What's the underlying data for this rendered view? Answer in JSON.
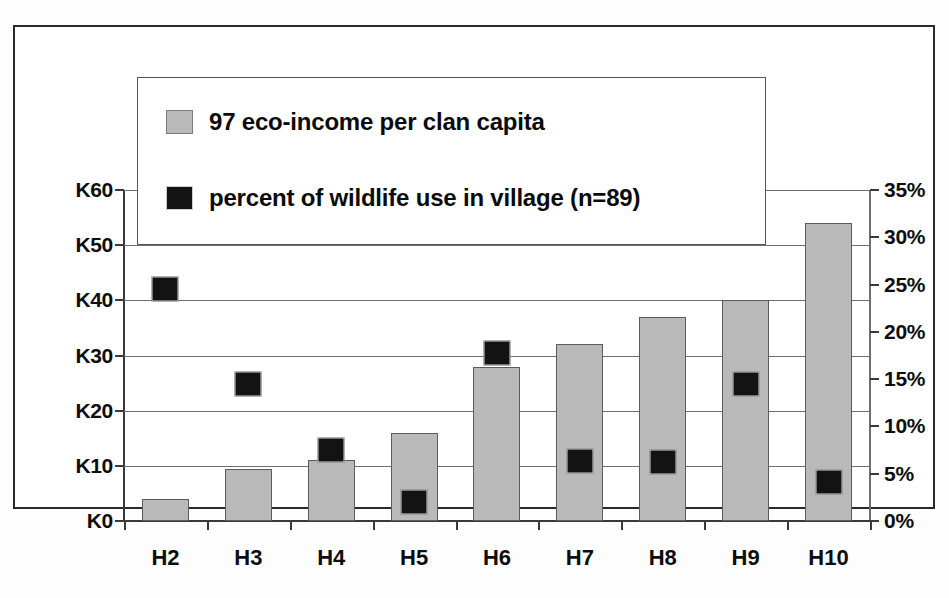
{
  "chart_data": {
    "type": "bar",
    "title": "",
    "subtitle": "",
    "xlabel": "",
    "ylabel": "",
    "grid": true,
    "legend_position": "top-center-inside",
    "categories": [
      "H2",
      "H3",
      "H4",
      "H5",
      "H6",
      "H7",
      "H8",
      "H9",
      "H10"
    ],
    "left_axis": {
      "label": "",
      "ticks": [
        "K0",
        "K10",
        "K20",
        "K30",
        "K40",
        "K50",
        "K60"
      ],
      "tick_values": [
        0,
        10,
        20,
        30,
        40,
        50,
        60
      ],
      "ylim": [
        0,
        60
      ],
      "unit": "K"
    },
    "right_axis": {
      "label": "",
      "ticks": [
        "0%",
        "5%",
        "10%",
        "15%",
        "20%",
        "25%",
        "30%",
        "35%"
      ],
      "tick_values": [
        0,
        5,
        10,
        15,
        20,
        25,
        30,
        35
      ],
      "ylim": [
        0,
        35
      ],
      "unit": "%"
    },
    "series": [
      {
        "name": "97 eco-income per clan capita",
        "type": "bar",
        "axis": "left",
        "color": "#b9b9b9",
        "values": [
          4,
          9.5,
          11,
          16,
          28,
          32,
          37,
          40,
          54
        ]
      },
      {
        "name": "percent of wildlife use in village (n=89)",
        "type": "scatter",
        "axis": "right",
        "color": "#131313",
        "values": [
          24.5,
          14.5,
          7.5,
          2,
          17.8,
          6.3,
          6.2,
          14.5,
          4.1
        ]
      }
    ]
  },
  "legend": {
    "items": [
      {
        "label": "97 eco-income per clan capita",
        "swatch": "bar-swatch"
      },
      {
        "label": "percent of wildlife use in village (n=89)",
        "swatch": "marker-swatch"
      }
    ]
  },
  "colors": {
    "bar_fill": "#b9b9b9",
    "bar_stroke": "#5c5c5c",
    "marker_fill": "#131313",
    "grid": "#6f6f6f",
    "axis": "#3a3a3a",
    "frame": "#2a2a2a",
    "background": "#ffffff",
    "text": "#0d0d0d"
  }
}
